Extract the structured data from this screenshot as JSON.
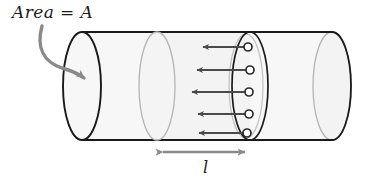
{
  "figure": {
    "background_color": "#ffffff"
  },
  "labels": {
    "area": "Area = A",
    "length": "l"
  },
  "colors": {
    "outline_dark": "#1a1a1a",
    "outline_light": "#b0b0b0",
    "cylinder_fill": "#f7f7f7",
    "cylinder_fill_shade": "#f1f1f1",
    "annotation_gray": "#8a8a8a",
    "arrow_dark": "#4a4a4a",
    "particle_fill": "#ffffff",
    "particle_stroke": "#2b2b2b"
  },
  "cylinder": {
    "name": "conductor-cylinder",
    "left_cap_center_x": 82,
    "right_cap_center_x": 332,
    "cap_radius_x": 19,
    "cap_radius_y": 54,
    "top_y": 32,
    "bottom_y": 140
  },
  "cross_sections": [
    {
      "name": "cross-section-left",
      "center_x": 157,
      "style": "light"
    },
    {
      "name": "cross-section-right",
      "center_x": 250,
      "style": "dark"
    }
  ],
  "particles": [
    {
      "cx": 248,
      "cy": 47,
      "arrow_tip_x": 200,
      "radius": 4
    },
    {
      "cx": 250,
      "cy": 70,
      "arrow_tip_x": 194,
      "radius": 4
    },
    {
      "cx": 249,
      "cy": 92,
      "arrow_tip_x": 189,
      "radius": 4
    },
    {
      "cx": 249,
      "cy": 114,
      "arrow_tip_x": 195,
      "radius": 4
    },
    {
      "cx": 247,
      "cy": 133,
      "arrow_tip_x": 196,
      "radius": 4
    }
  ],
  "annotations": {
    "area_pointer": {
      "name": "area-callout-arrow",
      "description": "curved gray arrow from Area label to left cap face",
      "from_x": 42,
      "from_y": 26,
      "to_x": 84,
      "to_y": 75
    },
    "length_dimension": {
      "name": "length-dimension-arrow",
      "left_x": 158,
      "right_x": 250,
      "y": 152
    }
  }
}
